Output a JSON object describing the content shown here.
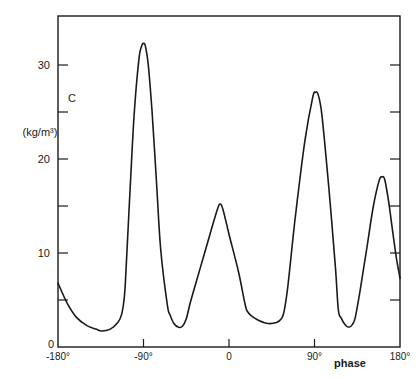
{
  "chart_data": {
    "type": "line",
    "title": "",
    "xlabel": "phase",
    "ylabel": "C",
    "ylabel_unit": "(kg/m³)",
    "xlim": [
      -180,
      180
    ],
    "ylim": [
      0,
      35
    ],
    "grid": false,
    "legend": null,
    "x_ticks": [
      -180,
      -90,
      0,
      90,
      180
    ],
    "x_tick_labels": [
      "-180°",
      "-90°",
      "0",
      "90°",
      "180°"
    ],
    "y_ticks_labeled": [
      0,
      10,
      20,
      30
    ],
    "y_tick_labels": [
      "0",
      "10",
      "20",
      "30"
    ],
    "y_ticks_minor": [
      5,
      15,
      25
    ],
    "series": [
      {
        "name": "C",
        "x": [
          -180,
          -170,
          -160,
          -150,
          -140,
          -134,
          -125,
          -117,
          -113,
          -110,
          -108,
          -104,
          -100,
          -95,
          -92,
          -90,
          -88,
          -85,
          -81,
          -76,
          -72,
          -65,
          -62,
          -58,
          -53,
          -49,
          -45,
          -40,
          -30,
          -20,
          -12,
          -9,
          -6,
          0,
          10,
          17,
          20,
          25,
          32,
          41,
          50,
          55,
          58,
          62,
          70,
          80,
          88,
          91,
          94,
          98,
          105,
          112,
          115,
          118,
          122,
          126,
          130,
          133,
          138,
          145,
          152,
          158,
          161,
          164,
          168,
          172,
          176,
          180
        ],
        "y": [
          6.8,
          4.6,
          3.1,
          2.3,
          1.9,
          1.7,
          1.9,
          2.6,
          3.5,
          5.5,
          9.0,
          17.0,
          24.5,
          30.5,
          32.0,
          32.3,
          32.0,
          30.0,
          25.0,
          17.0,
          10.5,
          4.5,
          3.4,
          2.5,
          2.1,
          2.2,
          3.0,
          5.0,
          8.5,
          12.0,
          14.7,
          15.2,
          14.5,
          12.0,
          8.0,
          4.5,
          3.7,
          3.2,
          2.8,
          2.5,
          2.6,
          3.0,
          3.8,
          6.5,
          14.0,
          22.0,
          26.5,
          27.1,
          26.8,
          24.5,
          17.0,
          8.5,
          4.0,
          3.1,
          2.4,
          2.1,
          2.4,
          3.2,
          6.0,
          10.5,
          15.0,
          17.7,
          18.1,
          17.8,
          15.5,
          12.5,
          9.6,
          7.3
        ]
      }
    ]
  },
  "axis_labels": {
    "y_title": "C",
    "y_unit": "(kg/m³)",
    "x_title": "phase",
    "zero_label": "0"
  }
}
